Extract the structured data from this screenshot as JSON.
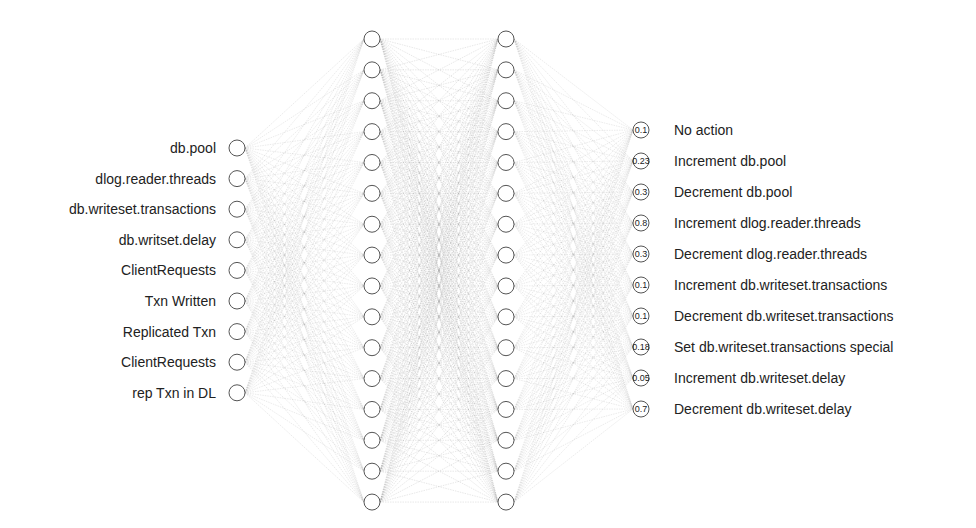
{
  "diagram": {
    "type": "neural-network",
    "layers": [
      {
        "name": "input",
        "x": 237,
        "y_start": 148,
        "spacing": 30.6,
        "node_count": 9,
        "labels": [
          "db.pool",
          "dlog.reader.threads",
          "db.writeset.transactions",
          "db.writset.delay",
          "ClientRequests",
          "Txn Written",
          "Replicated Txn",
          "ClientRequests",
          "rep Txn in DL"
        ]
      },
      {
        "name": "hidden-1",
        "x": 372,
        "y_start": 39,
        "spacing": 30.87,
        "node_count": 16
      },
      {
        "name": "hidden-2",
        "x": 506,
        "y_start": 39,
        "spacing": 30.87,
        "node_count": 16
      },
      {
        "name": "output",
        "x": 641,
        "y_start": 130,
        "spacing": 31,
        "node_count": 10,
        "values": [
          "0.1",
          "0.23",
          "0.3",
          "0.8",
          "0.3",
          "0.1",
          "0.1",
          "0.18",
          "0.05",
          "0.7"
        ],
        "labels": [
          "No action",
          "Increment db.pool",
          "Decrement db.pool",
          "Increment dlog.reader.threads",
          "Decrement dlog.reader.threads",
          "Increment db.writeset.transactions",
          "Decrement db.writeset.transactions",
          "Set db.writeset.transactions special",
          "Increment db.writeset.delay",
          "Decrement db.writeset.delay"
        ]
      }
    ],
    "node_radius": 8,
    "colors": {
      "node_stroke": "#555555",
      "node_fill": "#ffffff",
      "edge": "#9a9a9a",
      "text": "#222222"
    }
  }
}
